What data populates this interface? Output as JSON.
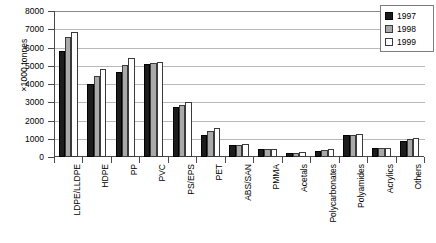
{
  "chart_data": {
    "type": "bar",
    "title": "",
    "xlabel": "",
    "ylabel": "×1000 tonnes",
    "ylim": [
      0,
      8000
    ],
    "ytick_step": 1000,
    "yticks": [
      0,
      1000,
      2000,
      3000,
      4000,
      5000,
      6000,
      7000,
      8000
    ],
    "grid": true,
    "legend_position": "top-right",
    "categories": [
      "LDPE/LLDPE",
      "HDPE",
      "PP",
      "PVC",
      "PS/EPS",
      "PET",
      "ABS/SAN",
      "PMMA",
      "Acetals",
      "Polycarbonates",
      "Polyamides",
      "Acrylics",
      "Others"
    ],
    "series": [
      {
        "name": "1997",
        "color": "#1c1c1c",
        "values": [
          5800,
          3980,
          4650,
          5080,
          2750,
          1200,
          660,
          430,
          230,
          330,
          1200,
          510,
          900
        ]
      },
      {
        "name": "1998",
        "color": "#a9a9a9",
        "values": [
          6550,
          4450,
          5030,
          5150,
          2850,
          1400,
          680,
          420,
          240,
          390,
          1230,
          480,
          990
        ]
      },
      {
        "name": "1999",
        "color": "#ffffff",
        "values": [
          6830,
          4800,
          5400,
          5180,
          3000,
          1600,
          690,
          420,
          280,
          440,
          1280,
          470,
          1020
        ]
      }
    ]
  },
  "legend": {
    "entries": [
      {
        "label": "1997"
      },
      {
        "label": "1998"
      },
      {
        "label": "1999"
      }
    ]
  }
}
